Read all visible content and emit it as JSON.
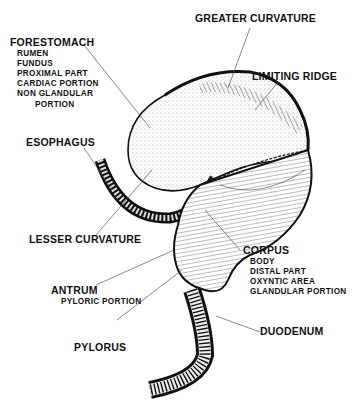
{
  "diagram": {
    "labels": {
      "forestomach": {
        "title": "FORESTOMACH",
        "synonyms": [
          "RUMEN",
          "FUNDUS",
          "PROXIMAL PART",
          "CARDIAC PORTION",
          "NON GLANDULAR",
          "PORTION"
        ]
      },
      "greater_curvature": {
        "title": "GREATER CURVATURE"
      },
      "limiting_ridge": {
        "title": "LIMITING RIDGE"
      },
      "esophagus": {
        "title": "ESOPHAGUS"
      },
      "lesser_curvature": {
        "title": "LESSER CURVATURE"
      },
      "corpus": {
        "title": "CORPUS",
        "synonyms": [
          "BODY",
          "DISTAL PART",
          "OXYNTIC AREA",
          "GLANDULAR PORTION"
        ]
      },
      "antrum": {
        "title": "ANTRUM",
        "synonyms": [
          "PYLORIC PORTION"
        ]
      },
      "pylorus": {
        "title": "PYLORUS"
      },
      "duodenum": {
        "title": "DUODENUM"
      }
    },
    "colors": {
      "ink": "#111111",
      "leader": "#555555",
      "background": "#ffffff"
    }
  }
}
